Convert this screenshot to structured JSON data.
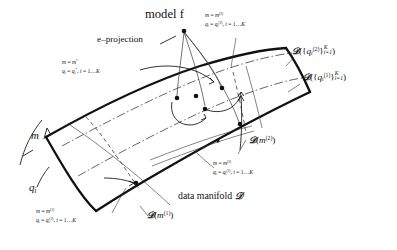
{
  "figure": {
    "kind": "information-geometry manifold diagram",
    "background": "#ffffff",
    "ink": "#111111",
    "width": 397,
    "height": 250
  },
  "labels": {
    "model_f": "model f",
    "e_projection": "e–projection",
    "data_manifold": "data manifold",
    "script_D": "𝒟",
    "m_axis": "m",
    "q_axis": "q",
    "q_axis_sub": "i",
    "star_line1_lhs": "m",
    "star_line1_rhs": "m",
    "star_line1_sup": "*",
    "star_line2": "q",
    "star_line2_sub": "i",
    "star_line2_rhs": "q",
    "star_line2_rhs_sub": "i",
    "star_line2_rhs_sup": "*",
    "index_range": "i = 1…K",
    "sup1": "(1)",
    "sup2": "(2)",
    "eq": "=",
    "comma": ", ",
    "K": "K",
    "i_eq_1": "i=1"
  },
  "annotations": [
    {
      "id": "top-right-state",
      "line1": "m = m(2)",
      "line2": "q_i = q_i(2), i = 1…K",
      "x": 205,
      "y": 14
    },
    {
      "id": "star-state",
      "line1": "m = m*",
      "line2": "q_i = q_i*, i = 1…K",
      "x": 62,
      "y": 62
    },
    {
      "id": "mid-right-state",
      "line1": "m = m(2)",
      "line2": "q_i = q_i(1), i = 1…K",
      "x": 213,
      "y": 162
    },
    {
      "id": "bottom-left-state",
      "line1": "m = m(1)",
      "line2": "q_i = q_i(1), i = 1…K",
      "x": 36,
      "y": 210
    }
  ],
  "curve_labels": [
    {
      "id": "D-q2-family",
      "text": "𝒟({q_i(2)}_{i=1}^{K})",
      "x": 292,
      "y": 46
    },
    {
      "id": "D-q1-family",
      "text": "𝒟({q_i(1)}_{i=1}^{K})",
      "x": 303,
      "y": 72
    },
    {
      "id": "D-m2",
      "text": "𝒟(m(2))",
      "x": 249,
      "y": 137
    },
    {
      "id": "D-m1",
      "text": "𝒟(m(1))",
      "x": 147,
      "y": 212
    }
  ],
  "points": [
    {
      "id": "model-f-point",
      "x": 184,
      "y": 31
    },
    {
      "id": "p-star",
      "x": 177,
      "y": 98
    },
    {
      "id": "p-upper-mid",
      "x": 196,
      "y": 96
    },
    {
      "id": "p-center",
      "x": 205,
      "y": 108
    },
    {
      "id": "p-right-upper",
      "x": 222,
      "y": 89
    },
    {
      "id": "p-right-lower",
      "x": 240,
      "y": 124
    },
    {
      "id": "p-small-mid",
      "x": 218,
      "y": 140
    },
    {
      "id": "p-lower-left",
      "x": 136,
      "y": 183
    }
  ]
}
